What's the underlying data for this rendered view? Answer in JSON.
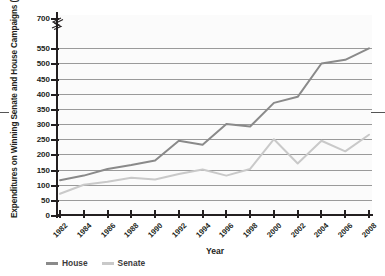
{
  "chart_data": {
    "type": "line",
    "title": "",
    "xlabel": "Year",
    "ylabel": "Expenditures on Winning Senate and House Campaigns (in millions)",
    "categories": [
      1982,
      1984,
      1986,
      1988,
      1990,
      1992,
      1994,
      1996,
      1998,
      2000,
      2002,
      2004,
      2006,
      2008
    ],
    "x_tick_labels": [
      "1982",
      "1984",
      "1986",
      "1988",
      "1990",
      "1992",
      "1994",
      "1996",
      "1998",
      "2000",
      "2002",
      "2004",
      "2006",
      "2008"
    ],
    "y_tick_labels": [
      "0",
      "50",
      "100",
      "150",
      "200",
      "250",
      "300",
      "350",
      "400",
      "450",
      "500",
      "550",
      "700"
    ],
    "y_tick_values": [
      0,
      50,
      100,
      150,
      200,
      250,
      300,
      350,
      400,
      450,
      500,
      550,
      700
    ],
    "ylim": [
      0,
      700
    ],
    "axis_break": true,
    "axis_break_between": [
      550,
      700
    ],
    "grid": "horizontal",
    "legend_position": "bottom-left",
    "series": [
      {
        "name": "House",
        "color": "#8a8a8a",
        "values": [
          115,
          130,
          152,
          165,
          180,
          245,
          232,
          300,
          292,
          370,
          390,
          500,
          512,
          550
        ]
      },
      {
        "name": "Senate",
        "color": "#c9c9c9",
        "values": [
          70,
          100,
          110,
          123,
          117,
          135,
          150,
          130,
          152,
          250,
          170,
          245,
          210,
          265
        ]
      }
    ]
  },
  "legend": {
    "items": [
      {
        "label": "House",
        "color": "#8a8a8a",
        "swatch": "line-swatch"
      },
      {
        "label": "Senate",
        "color": "#c9c9c9",
        "swatch": "line-swatch"
      }
    ]
  },
  "axes": {
    "x_title": "Year",
    "y_title": "Expenditures on Winning Senate and House Campaigns (in millions)"
  }
}
